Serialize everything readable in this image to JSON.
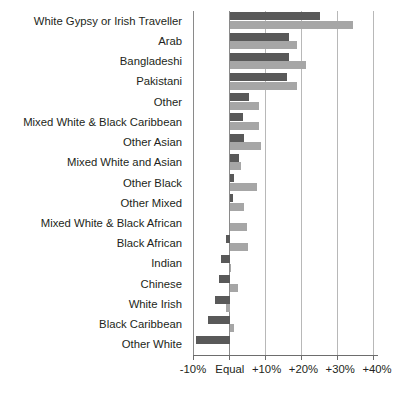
{
  "chart_data": {
    "type": "bar",
    "orientation": "horizontal",
    "title": "",
    "subtitle": "",
    "xlabel": "",
    "ylabel": "",
    "xlim": [
      -10,
      40
    ],
    "xticks": [
      -10,
      0,
      10,
      20,
      30,
      40
    ],
    "xtick_labels": [
      "-10%",
      "Equal",
      "+10%",
      "+20%",
      "+30%",
      "+40%"
    ],
    "grid": true,
    "legend": "none",
    "zero_label": "Equal",
    "categories": [
      "White Gypsy or Irish Traveller",
      "Arab",
      "Bangladeshi",
      "Pakistani",
      "Other",
      "Mixed White & Black Caribbean",
      "Other Asian",
      "Mixed White and Asian",
      "Other Black",
      "Other Mixed",
      "Mixed White & Black African",
      "Black African",
      "Indian",
      "Chinese",
      "White Irish",
      "Black Caribbean",
      "Other White"
    ],
    "series": [
      {
        "name": "series-a",
        "color": "#595959",
        "values": [
          24.5,
          16.1,
          16.1,
          15.6,
          5.3,
          3.6,
          3.9,
          2.5,
          1.1,
          0.8,
          0.0,
          -1.1,
          -2.5,
          -2.8,
          -3.9,
          -5.8,
          -9.2
        ]
      },
      {
        "name": "series-b",
        "color": "#a6a6a6",
        "values": [
          33.6,
          18.3,
          20.8,
          18.3,
          7.8,
          7.8,
          8.6,
          3.1,
          7.5,
          3.9,
          4.7,
          5.0,
          0.3,
          2.2,
          -1.1,
          1.1,
          0.0
        ]
      }
    ]
  }
}
